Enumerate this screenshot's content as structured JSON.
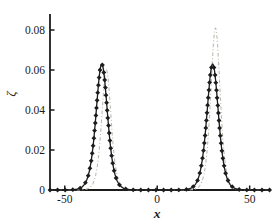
{
  "chart_data": {
    "type": "line",
    "title": "",
    "xlabel": "x",
    "ylabel": "ζ",
    "xlim": [
      -58,
      61
    ],
    "ylim": [
      0,
      0.088
    ],
    "x_ticks": [
      {
        "value": -50,
        "label": "-50"
      },
      {
        "value": 0,
        "label": "0"
      },
      {
        "value": 50,
        "label": "50"
      }
    ],
    "y_ticks": [
      {
        "value": 0,
        "label": "0"
      },
      {
        "value": 0.02,
        "label": "0.02"
      },
      {
        "value": 0.04,
        "label": "0.04"
      },
      {
        "value": 0.06,
        "label": "0.06"
      },
      {
        "value": 0.08,
        "label": "0.08"
      }
    ],
    "grid": false,
    "legend": "none",
    "axis_color": "#1b1b1b",
    "text_color": "#1b1b1b",
    "curve_model": "y(x) = sum of A*sech^2((x-c)/w) solitary-wave peaks",
    "series": [
      {
        "name": "solid-diamond-markers",
        "style": "solid",
        "color": "#1c1c1c",
        "marker": "diamond",
        "peaks": [
          {
            "center": -30,
            "amplitude": 0.063,
            "width": 4.2
          },
          {
            "center": 30,
            "amplitude": 0.063,
            "width": 4.2
          }
        ]
      },
      {
        "name": "dash-dot-light",
        "style": "dash-dot",
        "color": "#bcb9af",
        "marker": "none",
        "peaks": [
          {
            "center": -27.5,
            "amplitude": 0.06,
            "width": 3.4
          },
          {
            "center": 31.5,
            "amplitude": 0.081,
            "width": 3.4
          }
        ]
      }
    ]
  }
}
